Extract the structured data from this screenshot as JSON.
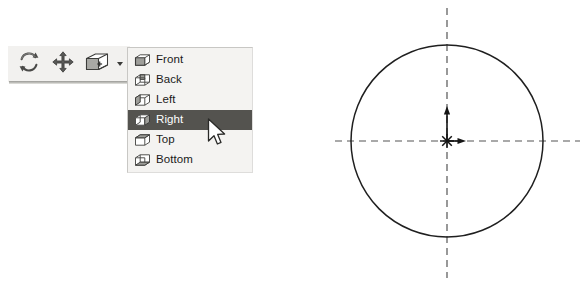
{
  "toolbar": {
    "name": "view-toolbar",
    "buttons": [
      {
        "id": "rotate-view",
        "icon": "rotate-view-icon",
        "tooltip": "Rotate View"
      },
      {
        "id": "pan-view",
        "icon": "pan-view-icon",
        "tooltip": "Pan"
      },
      {
        "id": "view-orientation",
        "icon": "view-orientation-cube-icon",
        "tooltip": "View Orientation"
      }
    ],
    "dropdown_caret": {
      "icon": "chevron-down-icon"
    }
  },
  "menu": {
    "name": "view-orientation-menu",
    "selected_index": 3,
    "items": [
      {
        "label": "Front",
        "icon": "cube-front-icon"
      },
      {
        "label": "Back",
        "icon": "cube-back-icon"
      },
      {
        "label": "Left",
        "icon": "cube-left-icon"
      },
      {
        "label": "Right",
        "icon": "cube-right-icon"
      },
      {
        "label": "Top",
        "icon": "cube-top-icon"
      },
      {
        "label": "Bottom",
        "icon": "cube-bottom-icon"
      }
    ]
  },
  "cursor": {
    "icon": "mouse-pointer-icon"
  },
  "sketch": {
    "name": "circle-sketch",
    "circle": {
      "cx": 117,
      "cy": 141,
      "r": 96
    },
    "origin": {
      "x": 117,
      "y": 141,
      "marker": "origin-star-icon"
    },
    "axes": {
      "vertical": {
        "x": 117,
        "y1": 8,
        "y2": 278,
        "style": "centerline-dashed"
      },
      "horizontal": {
        "y": 141,
        "x1": 5,
        "x2": 250,
        "style": "centerline-dashed"
      }
    },
    "arrows": [
      {
        "name": "y-axis-arrow",
        "direction": "up",
        "length": 33
      },
      {
        "name": "x-axis-arrow",
        "direction": "right",
        "length": 18
      }
    ]
  },
  "colors": {
    "menu_background": "#f4f3f1",
    "menu_selected_background": "#54534f",
    "menu_selected_text": "#ffffff",
    "menu_text": "#1a1a1a",
    "toolbar_background": "#f2f1ef",
    "sketch_line": "#1f1f1f",
    "centerline": "#555555"
  }
}
